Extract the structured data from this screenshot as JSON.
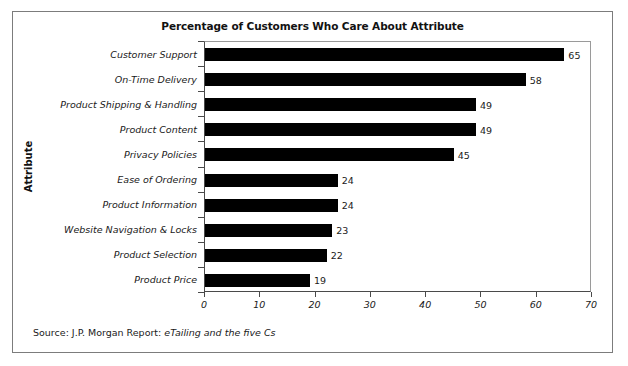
{
  "chart_data": {
    "type": "bar",
    "orientation": "horizontal",
    "title": "Percentage of Customers Who Care About Attribute",
    "xlabel": "",
    "ylabel": "Attribute",
    "xlim": [
      0,
      70
    ],
    "xticks": [
      0,
      10,
      20,
      30,
      40,
      50,
      60,
      70
    ],
    "grid": false,
    "legend": null,
    "bar_color": "#000000",
    "categories": [
      "Customer Support",
      "On-Time Delivery",
      "Product Shipping & Handling",
      "Product Content",
      "Privacy Policies",
      "Ease of Ordering",
      "Product Information",
      "Website Navigation & Locks",
      "Product Selection",
      "Product Price"
    ],
    "values": [
      65,
      58,
      49,
      49,
      45,
      24,
      24,
      23,
      22,
      19
    ],
    "value_labels": [
      "65",
      "58",
      "49",
      "49",
      "45",
      "24",
      "24",
      "23",
      "22",
      "19"
    ],
    "tick_labels": [
      "0",
      "10",
      "20",
      "30",
      "40",
      "50",
      "60",
      "70"
    ]
  },
  "source": {
    "prefix": "Source: J.P. Morgan Report: ",
    "italic": "eTailing and the five Cs"
  }
}
